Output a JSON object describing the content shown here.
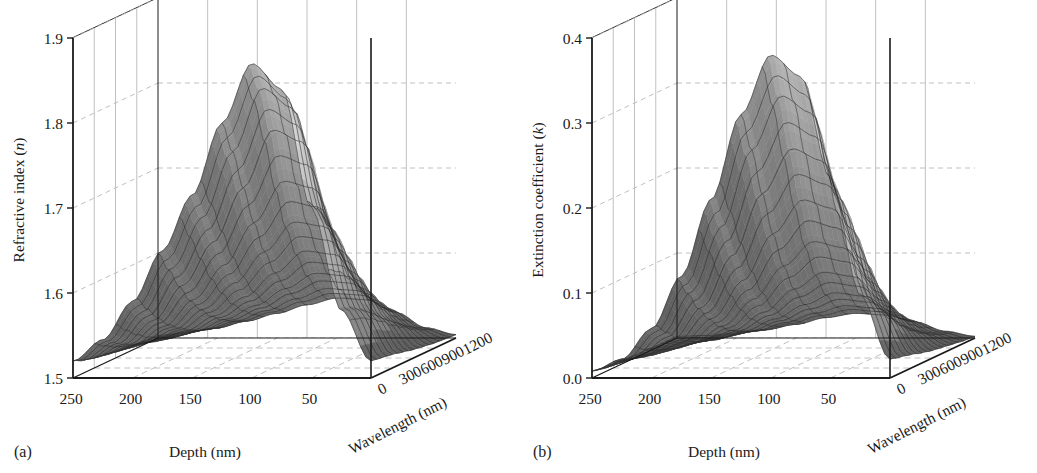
{
  "figure": {
    "background_color": "#ffffff",
    "ink_color": "#1a1a1a",
    "grid_color": "#b9b9b9",
    "panel_count": 2
  },
  "panels": [
    {
      "letter": "(a)",
      "zaxis_title_main": "Refractive index (",
      "zaxis_title_symbol": "n",
      "zaxis_title_close": ")",
      "xaxis_title": "Depth (nm)",
      "yaxis_title": "Wavelength (nm)",
      "z_ticks": [
        "1.9",
        "1.8",
        "1.7",
        "1.6",
        "1.5"
      ],
      "x_ticks": [
        "250",
        "200",
        "150",
        "100",
        "50"
      ],
      "y_ticks": [
        "0",
        "300",
        "600",
        "900",
        "1200"
      ]
    },
    {
      "letter": "(b)",
      "zaxis_title_main": "Extinction coefficient (",
      "zaxis_title_symbol": "k",
      "zaxis_title_close": ")",
      "xaxis_title": "Depth (nm)",
      "yaxis_title": "Wavelength (nm)",
      "z_ticks": [
        "0.4",
        "0.3",
        "0.2",
        "0.1",
        "0.0"
      ],
      "x_ticks": [
        "250",
        "200",
        "150",
        "100",
        "50"
      ],
      "y_ticks": [
        "0",
        "300",
        "600",
        "900",
        "1200"
      ]
    }
  ],
  "chart_data": [
    {
      "type": "surface",
      "panel": "(a)",
      "title": "",
      "xlabel": "Depth (nm)",
      "ylabel": "Wavelength (nm)",
      "zlabel": "Refractive index (n)",
      "xlim": [
        250,
        0
      ],
      "ylim": [
        0,
        1200
      ],
      "zlim": [
        1.5,
        1.9
      ],
      "x_ticks": [
        250,
        200,
        150,
        100,
        50
      ],
      "y_ticks": [
        0,
        300,
        600,
        900,
        1200
      ],
      "z_ticks": [
        1.9,
        1.8,
        1.7,
        1.6,
        1.5
      ],
      "grid": true,
      "legend": "none",
      "colormap": "grayscale",
      "description": "A tall narrow ridge of refractive index peaking near depth 80-100 nm that rises to about 1.87 at short wavelengths (near 0-300 nm), with a secondary lower shoulder near 1.66 extending toward longer wavelengths, and a broad low basin near 1.50-1.55 at large depths.",
      "x": [
        250,
        225,
        200,
        175,
        150,
        125,
        100,
        75,
        50,
        25,
        0
      ],
      "y": [
        0,
        150,
        300,
        450,
        600,
        750,
        900,
        1050,
        1200
      ],
      "z": [
        [
          1.52,
          1.515,
          1.512,
          1.51,
          1.508,
          1.506,
          1.505,
          1.504,
          1.503
        ],
        [
          1.545,
          1.536,
          1.528,
          1.522,
          1.518,
          1.514,
          1.511,
          1.509,
          1.507
        ],
        [
          1.59,
          1.572,
          1.556,
          1.543,
          1.534,
          1.526,
          1.52,
          1.516,
          1.512
        ],
        [
          1.65,
          1.624,
          1.598,
          1.575,
          1.558,
          1.544,
          1.534,
          1.526,
          1.52
        ],
        [
          1.715,
          1.683,
          1.648,
          1.615,
          1.588,
          1.566,
          1.55,
          1.538,
          1.529
        ],
        [
          1.8,
          1.76,
          1.712,
          1.665,
          1.625,
          1.594,
          1.57,
          1.552,
          1.539
        ],
        [
          1.87,
          1.835,
          1.78,
          1.714,
          1.66,
          1.62,
          1.588,
          1.564,
          1.547
        ],
        [
          1.84,
          1.812,
          1.766,
          1.706,
          1.655,
          1.616,
          1.585,
          1.562,
          1.545
        ],
        [
          1.7,
          1.686,
          1.662,
          1.63,
          1.6,
          1.575,
          1.556,
          1.541,
          1.53
        ],
        [
          1.58,
          1.576,
          1.568,
          1.558,
          1.546,
          1.536,
          1.526,
          1.518,
          1.512
        ],
        [
          1.52,
          1.518,
          1.516,
          1.513,
          1.51,
          1.508,
          1.506,
          1.505,
          1.504
        ]
      ]
    },
    {
      "type": "surface",
      "panel": "(b)",
      "title": "",
      "xlabel": "Depth (nm)",
      "ylabel": "Wavelength (nm)",
      "zlabel": "Extinction coefficient (k)",
      "xlim": [
        250,
        0
      ],
      "ylim": [
        0,
        1200
      ],
      "zlim": [
        0.0,
        0.4
      ],
      "x_ticks": [
        250,
        200,
        150,
        100,
        50
      ],
      "y_ticks": [
        0,
        300,
        600,
        900,
        1200
      ],
      "z_ticks": [
        0.4,
        0.3,
        0.2,
        0.1,
        0.0
      ],
      "grid": true,
      "legend": "none",
      "colormap": "grayscale",
      "description": "A single symmetric Gaussian-like peak of extinction coefficient centred near depth 80-100 nm and short wavelength, reaching about 0.38, falling to nearly 0.0 everywhere else across depth and wavelength.",
      "x": [
        250,
        225,
        200,
        175,
        150,
        125,
        100,
        75,
        50,
        25,
        0
      ],
      "y": [
        0,
        150,
        300,
        450,
        600,
        750,
        900,
        1050,
        1200
      ],
      "z": [
        [
          0.008,
          0.006,
          0.005,
          0.004,
          0.003,
          0.003,
          0.002,
          0.002,
          0.002
        ],
        [
          0.022,
          0.017,
          0.013,
          0.01,
          0.008,
          0.006,
          0.005,
          0.004,
          0.003
        ],
        [
          0.058,
          0.045,
          0.033,
          0.025,
          0.018,
          0.014,
          0.01,
          0.008,
          0.006
        ],
        [
          0.12,
          0.096,
          0.072,
          0.053,
          0.038,
          0.027,
          0.02,
          0.014,
          0.01
        ],
        [
          0.21,
          0.172,
          0.132,
          0.097,
          0.069,
          0.048,
          0.034,
          0.024,
          0.016
        ],
        [
          0.31,
          0.262,
          0.205,
          0.152,
          0.108,
          0.075,
          0.051,
          0.035,
          0.024
        ],
        [
          0.38,
          0.326,
          0.258,
          0.192,
          0.137,
          0.095,
          0.065,
          0.044,
          0.029
        ],
        [
          0.355,
          0.306,
          0.244,
          0.182,
          0.13,
          0.09,
          0.061,
          0.041,
          0.027
        ],
        [
          0.235,
          0.203,
          0.163,
          0.122,
          0.088,
          0.061,
          0.042,
          0.028,
          0.019
        ],
        [
          0.098,
          0.085,
          0.069,
          0.052,
          0.038,
          0.027,
          0.018,
          0.012,
          0.008
        ],
        [
          0.022,
          0.019,
          0.016,
          0.012,
          0.009,
          0.007,
          0.005,
          0.003,
          0.002
        ]
      ]
    }
  ]
}
